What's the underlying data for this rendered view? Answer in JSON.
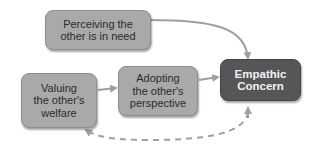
{
  "diagram": {
    "nodes": [
      {
        "id": "perceiving",
        "label_line1": "Perceiving the",
        "label_line2": "other is in need"
      },
      {
        "id": "valuing",
        "label_line1": "Valuing",
        "label_line2": "the other's",
        "label_line3": "welfare"
      },
      {
        "id": "adopting",
        "label_line1": "Adopting",
        "label_line2": "the other's",
        "label_line3": "perspective"
      },
      {
        "id": "empathic",
        "label_line1": "Empathic",
        "label_line2": "Concern"
      }
    ],
    "edges": [
      {
        "from": "perceiving",
        "to": "empathic",
        "style": "solid"
      },
      {
        "from": "valuing",
        "to": "adopting",
        "style": "solid"
      },
      {
        "from": "adopting",
        "to": "empathic",
        "style": "solid"
      },
      {
        "from": "empathic",
        "to": "valuing",
        "style": "dashed",
        "bidirectional": true
      }
    ],
    "colors": {
      "node": "#a9a9a9",
      "target_node": "#565656",
      "arrow": "#a0a0a0"
    }
  }
}
